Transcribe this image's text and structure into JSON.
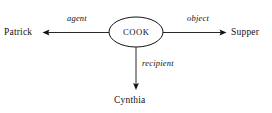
{
  "diagram": {
    "type": "semantic-case-frame-network",
    "background_color": "#ffffff",
    "stroke_color": "#111111",
    "predicate": {
      "label": "COOK",
      "shape": "ellipse",
      "center_x": 136,
      "center_y": 32,
      "radius_x": 27,
      "radius_y": 15
    },
    "nodes": [
      {
        "id": "patrick",
        "label": "Patrick",
        "position": "left"
      },
      {
        "id": "supper",
        "label": "Supper",
        "position": "right"
      },
      {
        "id": "cynthia",
        "label": "Cynthia",
        "position": "bottom"
      }
    ],
    "edges": [
      {
        "id": "agent",
        "label": "agent",
        "from": "COOK",
        "to": "Patrick",
        "direction": "left",
        "arrowhead": "at-target"
      },
      {
        "id": "object",
        "label": "object",
        "from": "COOK",
        "to": "Supper",
        "direction": "right",
        "arrowhead": "at-target"
      },
      {
        "id": "recipient",
        "label": "recipient",
        "from": "COOK",
        "to": "Cynthia",
        "direction": "down",
        "arrowhead": "at-target"
      }
    ]
  }
}
